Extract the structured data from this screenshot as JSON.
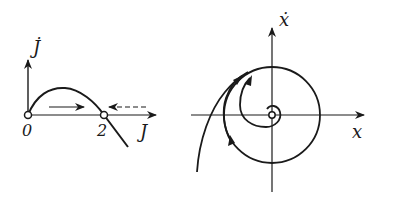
{
  "left_diagram": {
    "y_axis_label": "J̇",
    "x_axis_label": "J",
    "tick_labels": [
      "0",
      "2"
    ],
    "fixed_points": [
      0,
      2
    ],
    "curve": "parabola J̇ vs J, positive between 0 and 2, negative beyond 2",
    "flow_arrows": [
      {
        "style": "solid",
        "direction": "right",
        "region": "0 < J < 2"
      },
      {
        "style": "dashed",
        "direction": "left",
        "region": "J > 2"
      }
    ]
  },
  "right_diagram": {
    "y_axis_label": "ẋ",
    "x_axis_label": "x",
    "elements": [
      "limit cycle circle",
      "unstable focus at origin",
      "spiral trajectory from inside",
      "trajectory from outside"
    ]
  },
  "colors": {
    "ink": "#1a1a1a",
    "background": "#ffffff"
  }
}
